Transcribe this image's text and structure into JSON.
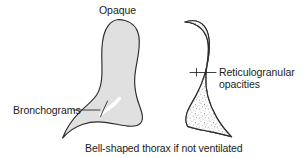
{
  "figure": {
    "background_color": "#ffffff",
    "width": 306,
    "height": 158
  },
  "colors": {
    "outline": "#2b2b2b",
    "opaque_lung_fill": "#e0e0e0",
    "stippled_lung_fill": "#ffffff",
    "stipple": "#8a8a8a",
    "text": "#1b1b1b",
    "leader_line": "#2a2a2a",
    "bronchogram_highlight": "#ffffff"
  },
  "labels": {
    "opaque": "Opaque",
    "bronchograms": "Bronchograms",
    "reticulogranular_line1": "Reticulogranular",
    "reticulogranular_line2": "opacities",
    "caption": "Bell-shaped thorax if not ventilated"
  },
  "shapes": {
    "left_lung": {
      "name": "opaque-lung-silhouette",
      "fill": "#e0e0e0",
      "description": "solid light gray opaque hemithorax with bell-shaped tapering base"
    },
    "right_lung": {
      "name": "reticulogranular-lung-silhouette",
      "fill": "#ffffff",
      "description": "white hemithorax filled with fine stippled reticulogranular opacities"
    },
    "bronchogram": {
      "name": "air-bronchogram-streak",
      "fill": "#ffffff",
      "description": "white diagonal branching streak within the opaque lung"
    }
  }
}
